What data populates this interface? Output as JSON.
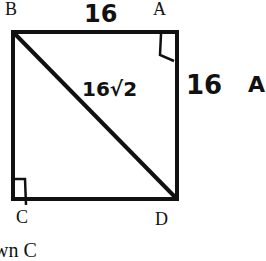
{
  "diagram": {
    "type": "square-with-diagonal",
    "vertices": {
      "top_left": "B",
      "top_right": "A",
      "bottom_left": "C",
      "bottom_right": "D"
    },
    "labels": {
      "top_side": "16",
      "right_side": "16",
      "diagonal": "16√2",
      "right_partial": "A"
    },
    "right_angle_marks": [
      "A",
      "C"
    ],
    "diagonal_from": "B",
    "diagonal_to": "D",
    "bottom_caption_partial": "wn C",
    "colors": {
      "stroke": "#111111",
      "background": "#ffffff"
    }
  }
}
